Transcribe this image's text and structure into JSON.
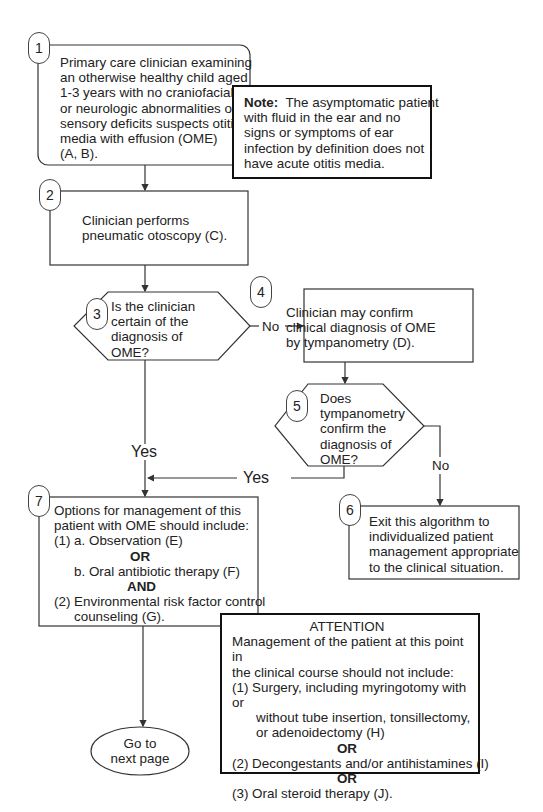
{
  "nodes": {
    "n1": {
      "number": "1",
      "lines": [
        "Primary care clinician examining",
        "an otherwise healthy child aged",
        "1-3 years with no craniofacial",
        "or neurologic abnormalities or",
        "sensory deficits suspects otitis",
        "media with effusion (OME)",
        "(A, B)."
      ]
    },
    "note": {
      "label": "Note:",
      "lines": [
        "The asymptomatic patient",
        "with fluid in the ear and no",
        "signs or symptoms of ear",
        "infection by definition does not",
        "have acute otitis media."
      ]
    },
    "n2": {
      "number": "2",
      "lines": [
        "Clinician performs",
        "pneumatic otoscopy (C)."
      ]
    },
    "n3": {
      "number": "3",
      "lines": [
        "Is the clinician",
        "certain of the",
        "diagnosis of",
        "OME?"
      ]
    },
    "n4": {
      "number": "4",
      "lines": [
        "Clinician may confirm",
        "clinical diagnosis of OME",
        "by tympanometry (D)."
      ]
    },
    "n5": {
      "number": "5",
      "lines": [
        "Does",
        "tympanometry",
        "confirm the",
        "diagnosis of",
        "OME?"
      ]
    },
    "n6": {
      "number": "6",
      "lines": [
        "Exit this algorithm to",
        "individualized patient",
        "management appropriate",
        "to the clinical situation."
      ]
    },
    "n7": {
      "number": "7",
      "line1": "Options for management of this",
      "line2": "patient with OME should include:",
      "item1a": "(1)  a.  Observation (E)",
      "or1": "OR",
      "item1b": "b.   Oral antibiotic therapy (F)",
      "and": "AND",
      "item2": "(2)  Environmental risk factor control",
      "item2cont": "counseling (G)."
    },
    "attention": {
      "title": "ATTENTION",
      "intro1": "Management of the patient at this point in",
      "intro2": "the clinical course should not include:",
      "item1": "(1)  Surgery, including myringotomy with or",
      "item1b": "without tube insertion, tonsillectomy,",
      "item1c": "or adenoidectomy (H)",
      "or1": "OR",
      "item2": "(2)  Decongestants and/or antihistamines (I)",
      "or2": "OR",
      "item3": "(3)  Oral steroid therapy (J)."
    },
    "terminal": {
      "lines": [
        "Go to",
        "next page"
      ]
    }
  },
  "edges": {
    "n3_no": "No",
    "n3_yes": "Yes",
    "n5_yes": "Yes",
    "n5_no": "No"
  },
  "colors": {
    "stroke": "#333333",
    "text": "#222222",
    "background": "#ffffff"
  }
}
